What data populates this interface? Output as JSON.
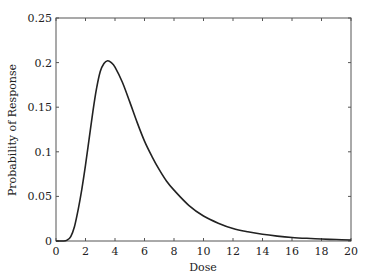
{
  "chart_data": {
    "type": "line",
    "title": "",
    "xlabel": "Dose",
    "ylabel": "Probability of Response",
    "xlim": [
      0,
      20
    ],
    "ylim": [
      0,
      0.25
    ],
    "xticks": [
      0,
      2,
      4,
      6,
      8,
      10,
      12,
      14,
      16,
      18,
      20
    ],
    "yticks": [
      0,
      0.05,
      0.1,
      0.15,
      0.2,
      0.25
    ],
    "xtick_labels": [
      "0",
      "2",
      "4",
      "6",
      "8",
      "10",
      "12",
      "14",
      "16",
      "18",
      "20"
    ],
    "ytick_labels": [
      "0",
      "0.05",
      "0.1",
      "0.15",
      "0.2",
      "0.25"
    ],
    "grid": false,
    "legend": null,
    "series": [
      {
        "name": "Probability of Response",
        "color": "#222222",
        "x": [
          0,
          0.5,
          0.75,
          1,
          1.25,
          1.5,
          1.75,
          2,
          2.25,
          2.5,
          2.75,
          3,
          3.25,
          3.5,
          3.75,
          4,
          4.5,
          5,
          5.5,
          6,
          6.5,
          7,
          7.5,
          8,
          9,
          10,
          11,
          12,
          13,
          14,
          15,
          16,
          17,
          18,
          19,
          20
        ],
        "y": [
          0,
          0,
          0.001,
          0.005,
          0.016,
          0.035,
          0.058,
          0.085,
          0.115,
          0.145,
          0.171,
          0.19,
          0.199,
          0.202,
          0.2,
          0.195,
          0.178,
          0.156,
          0.133,
          0.112,
          0.095,
          0.08,
          0.067,
          0.057,
          0.04,
          0.028,
          0.02,
          0.014,
          0.0103,
          0.0075,
          0.0055,
          0.004,
          0.003,
          0.0022,
          0.0016,
          0.0012
        ]
      }
    ]
  },
  "plot_area": {
    "left": 56,
    "top": 18,
    "right": 351,
    "bottom": 241
  }
}
